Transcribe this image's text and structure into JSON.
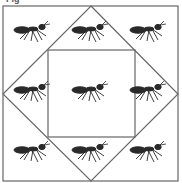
{
  "figure": {
    "label": "Fig",
    "stroke_color": "#666666",
    "ant_color": "#2a2a2a",
    "outer_square": {
      "x": 3,
      "y": 6,
      "size": 175
    },
    "diamond": {
      "top": [
        91,
        6
      ],
      "right": [
        178,
        94
      ],
      "bottom": [
        91,
        181
      ],
      "left": [
        3,
        94
      ]
    },
    "inner_square": {
      "x": 48,
      "y": 50,
      "size": 87
    },
    "ants": [
      {
        "row": 0,
        "col": 0,
        "cx": 32,
        "cy": 30
      },
      {
        "row": 0,
        "col": 1,
        "cx": 90,
        "cy": 30
      },
      {
        "row": 0,
        "col": 2,
        "cx": 148,
        "cy": 30
      },
      {
        "row": 1,
        "col": 0,
        "cx": 32,
        "cy": 90
      },
      {
        "row": 1,
        "col": 1,
        "cx": 90,
        "cy": 90
      },
      {
        "row": 1,
        "col": 2,
        "cx": 148,
        "cy": 90
      },
      {
        "row": 2,
        "col": 0,
        "cx": 32,
        "cy": 150
      },
      {
        "row": 2,
        "col": 1,
        "cx": 90,
        "cy": 150
      },
      {
        "row": 2,
        "col": 2,
        "cx": 148,
        "cy": 150
      }
    ]
  }
}
